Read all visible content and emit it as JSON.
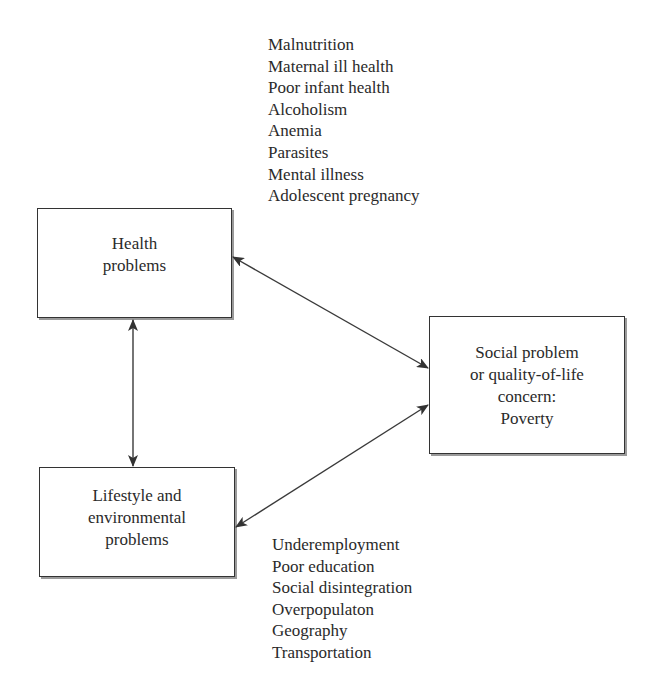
{
  "diagram": {
    "nodes": {
      "health": {
        "lines": [
          "Health",
          "problems"
        ]
      },
      "lifestyle": {
        "lines": [
          "Lifestyle and",
          "environmental",
          "problems"
        ]
      },
      "social": {
        "lines": [
          "Social problem",
          "or quality-of-life",
          "concern:",
          "Poverty"
        ]
      }
    },
    "health_factors": [
      "Malnutrition",
      "Maternal ill health",
      "Poor infant health",
      "Alcoholism",
      "Anemia",
      "Parasites",
      "Mental illness",
      "Adolescent pregnancy"
    ],
    "lifestyle_factors": [
      "Underemployment",
      "Poor education",
      "Social disintegration",
      "Overpopulaton",
      "Geography",
      "Transportation"
    ],
    "edges": [
      {
        "from": "health",
        "to": "social",
        "type": "bidirectional"
      },
      {
        "from": "lifestyle",
        "to": "social",
        "type": "bidirectional"
      },
      {
        "from": "health",
        "to": "lifestyle",
        "type": "bidirectional"
      }
    ],
    "colors": {
      "line": "#333333",
      "text": "#2a2a2a",
      "shadow": "#9a9a9a",
      "background": "#ffffff"
    }
  }
}
